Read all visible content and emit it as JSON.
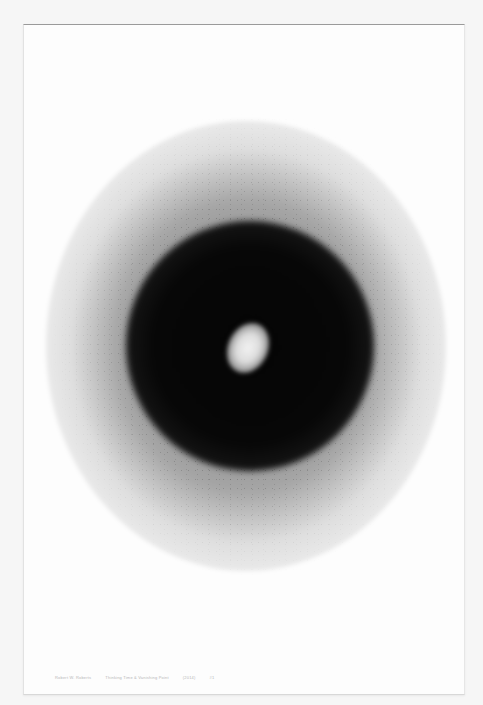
{
  "artwork": {
    "description": "Drawing on paper: dense black circular disc with a bright off-center light core, surrounded by scattered dotted halo",
    "colors": {
      "background": "#f6f6f6",
      "paper": "#fdfdfd",
      "disc": "#070707",
      "core": "#eeeeee"
    }
  },
  "caption": {
    "artist": "Robert W. Roberts",
    "title": "Thinking Time & Vanishing Point",
    "date": "(2014)",
    "number": "#1"
  }
}
